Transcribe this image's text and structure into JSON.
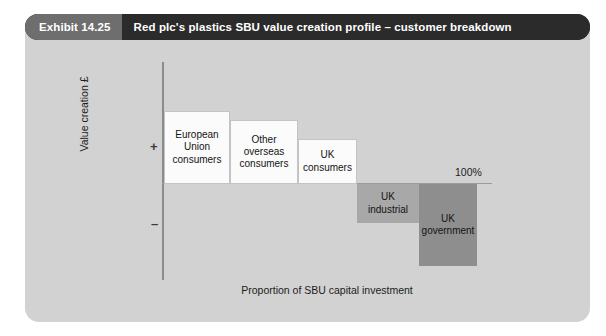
{
  "header": {
    "exhibit_label": "Exhibit 14.25",
    "title": "Red plc's plastics SBU value creation profile – customer breakdown"
  },
  "axes": {
    "y_title": "Value creation £",
    "y_positive_sign": "+",
    "y_negative_sign": "–",
    "x_title": "Proportion of SBU capital investment",
    "x_end_label": "100%"
  },
  "colors": {
    "panel_background": "#d2d2d2",
    "header_dark": "#2b2b2b",
    "header_gray": "#6e6e6e",
    "positive_bar": "#fbfbfb",
    "negative_bar_light": "#a8a8a8",
    "negative_bar_dark": "#8e8e8e",
    "axis_line": "#8b8b8b"
  },
  "chart_data": {
    "type": "bar",
    "title": "Red plc's plastics SBU value creation profile – customer breakdown",
    "xlabel": "Proportion of SBU capital investment",
    "ylabel": "Value creation £",
    "grid": false,
    "legend": false,
    "note": "Value creation waterfall / bar-of-width chart: bar width = share of SBU capital investment (cumulative to 100%), bar height = value creation per unit (positive above axis, negative below).",
    "categories": [
      "European Union consumers",
      "Other overseas consumers",
      "UK consumers",
      "UK industrial",
      "UK government"
    ],
    "values": [
      32,
      23,
      13,
      -18,
      -39
    ],
    "widths": [
      20,
      21,
      18,
      19,
      18
    ],
    "cumulative_width": [
      0,
      20,
      41,
      59,
      78,
      96
    ],
    "bars": [
      {
        "label": "European Union consumers",
        "label_lines": [
          "European",
          "Union",
          "consumers"
        ],
        "sign": "positive",
        "value": 32,
        "width_share": 20,
        "fill": "#fbfbfb"
      },
      {
        "label": "Other overseas consumers",
        "label_lines": [
          "Other",
          "overseas",
          "consumers"
        ],
        "sign": "positive",
        "value": 23,
        "width_share": 21,
        "fill": "#fbfbfb"
      },
      {
        "label": "UK consumers",
        "label_lines": [
          "UK",
          "consumers"
        ],
        "sign": "positive",
        "value": 13,
        "width_share": 18,
        "fill": "#fbfbfb"
      },
      {
        "label": "UK industrial",
        "label_lines": [
          "UK",
          "industrial"
        ],
        "sign": "negative",
        "value": -18,
        "width_share": 19,
        "fill": "#a8a8a8"
      },
      {
        "label": "UK government",
        "label_lines": [
          "UK",
          "government"
        ],
        "sign": "negative",
        "value": -39,
        "width_share": 18,
        "fill": "#8e8e8e"
      }
    ],
    "annotations": [
      {
        "text": "100%",
        "position": "end-of-x-axis-above-zero-line"
      }
    ]
  }
}
